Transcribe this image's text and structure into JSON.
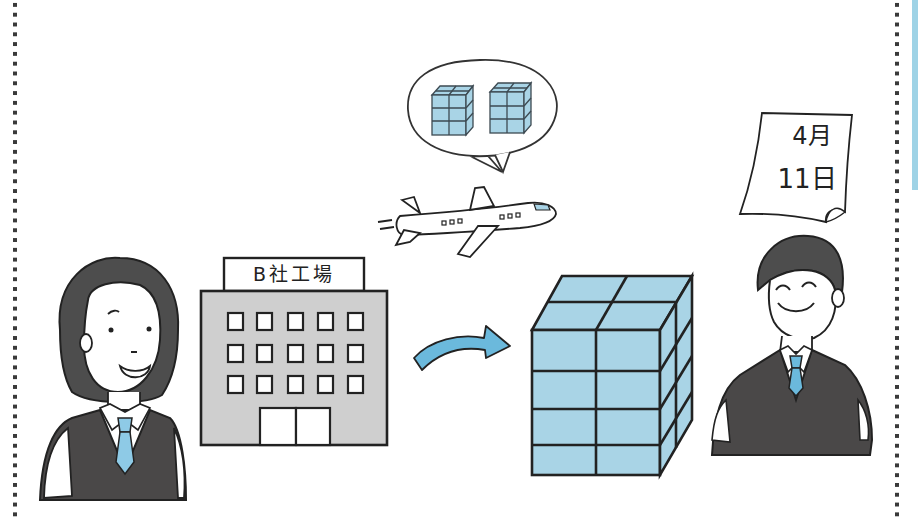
{
  "scene": {
    "description": "Illustration: woman office worker, factory B, airplane delivering cargo, stacked boxes, man office worker, calendar date",
    "factory": {
      "sign": "B社工場",
      "windows_rows": 3,
      "windows_cols": 5
    },
    "calendar": {
      "month": "4月",
      "day": "11日"
    },
    "speech_bubble": {
      "content": "two cube-stacks of boxes"
    },
    "cargo_stack": {
      "cols": 2,
      "rows": 4
    },
    "colors": {
      "box_blue": "#a9d4e6",
      "tie_blue": "#8ecae6",
      "arrow_blue": "#6bb9dc",
      "suit_dark": "#4a4848",
      "hair_dark": "#4d4d4d",
      "building_gray": "#cfcfcf",
      "line": "#222222",
      "dots": "#3a3a3a"
    }
  }
}
